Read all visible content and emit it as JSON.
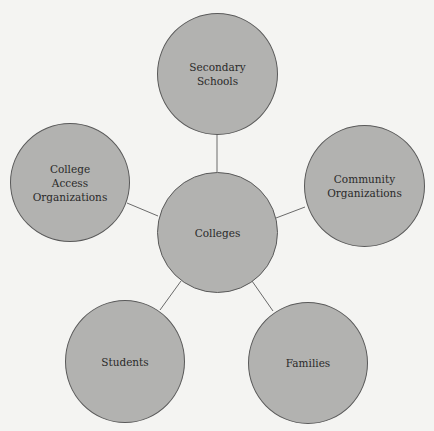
{
  "diagram": {
    "type": "hub-and-spoke",
    "colors": {
      "background": "#f4f4f2",
      "node_fill": "#b2b2b0",
      "node_stroke": "#5a5a5a",
      "edge": "#6a6a6a",
      "text": "#2a2a2a"
    },
    "center": {
      "id": "colleges",
      "label": "Colleges"
    },
    "nodes": [
      {
        "id": "secondary-schools",
        "label": "Secondary\nSchools"
      },
      {
        "id": "community-organizations",
        "label": "Community\nOrganizations"
      },
      {
        "id": "families",
        "label": "Families"
      },
      {
        "id": "students",
        "label": "Students"
      },
      {
        "id": "college-access-organizations",
        "label": "College\nAccess\nOrganizations"
      }
    ],
    "edges": [
      [
        "colleges",
        "secondary-schools"
      ],
      [
        "colleges",
        "community-organizations"
      ],
      [
        "colleges",
        "families"
      ],
      [
        "colleges",
        "students"
      ],
      [
        "colleges",
        "college-access-organizations"
      ]
    ]
  }
}
